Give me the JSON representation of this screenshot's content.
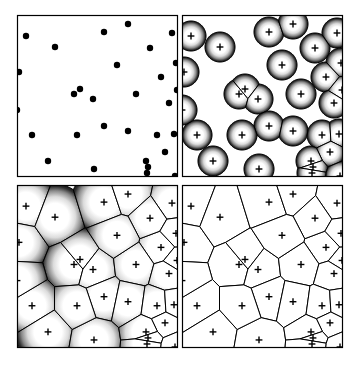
{
  "figure": {
    "type": "scientific-diagram",
    "background_color": "#ffffff",
    "line_color": "#000000",
    "seed_marker_color": "#000000",
    "grain_fill_light": "#ffffff",
    "grain_fill_dark": "#1a1a1a",
    "panel_count": 4,
    "panel_layout": "2x2",
    "panels": [
      {
        "id": "panel-a",
        "stage": "nucleation",
        "marker_style": "filled-dot",
        "frame": {
          "x": 17,
          "y": 15,
          "w": 161,
          "h": 162
        },
        "grain_radius": 0
      },
      {
        "id": "panel-b",
        "stage": "early-growth",
        "marker_style": "plus",
        "frame": {
          "x": 182,
          "y": 15,
          "w": 161,
          "h": 162
        },
        "grain_radius": 15
      },
      {
        "id": "panel-c",
        "stage": "impingement",
        "marker_style": "plus",
        "frame": {
          "x": 17,
          "y": 185,
          "w": 161,
          "h": 163
        },
        "grain_radius": 33
      },
      {
        "id": "panel-d",
        "stage": "full-tessellation",
        "marker_style": "plus",
        "frame": {
          "x": 182,
          "y": 185,
          "w": 161,
          "h": 163
        },
        "grain_radius": 200
      }
    ]
  },
  "chart_data": {
    "type": "scatter",
    "xlabel": "",
    "ylabel": "",
    "xlim": [
      0,
      161
    ],
    "ylim": [
      0,
      162
    ],
    "grid": false,
    "legend": "none",
    "seed_count": 30,
    "seeds": [
      {
        "id": 1,
        "x": 9,
        "y": 21
      },
      {
        "id": 2,
        "x": 2,
        "y": 57
      },
      {
        "id": 3,
        "x": 38,
        "y": 32
      },
      {
        "id": 4,
        "x": 87,
        "y": 17
      },
      {
        "id": 5,
        "x": 111,
        "y": 9
      },
      {
        "id": 6,
        "x": 155,
        "y": 18
      },
      {
        "id": 7,
        "x": 144,
        "y": 62
      },
      {
        "id": 8,
        "x": 160,
        "y": 75
      },
      {
        "id": 9,
        "x": 57,
        "y": 79
      },
      {
        "id": 10,
        "x": 63,
        "y": 74
      },
      {
        "id": 11,
        "x": 76,
        "y": 84
      },
      {
        "id": 12,
        "x": 119,
        "y": 79
      },
      {
        "id": 13,
        "x": 152,
        "y": 88
      },
      {
        "id": 14,
        "x": 87,
        "y": 111
      },
      {
        "id": 15,
        "x": 111,
        "y": 116
      },
      {
        "id": 16,
        "x": 15,
        "y": 120
      },
      {
        "id": 17,
        "x": 140,
        "y": 120
      },
      {
        "id": 18,
        "x": 157,
        "y": 119
      },
      {
        "id": 19,
        "x": 148,
        "y": 137
      },
      {
        "id": 20,
        "x": 31,
        "y": 146
      },
      {
        "id": 21,
        "x": 77,
        "y": 154
      },
      {
        "id": 22,
        "x": 129,
        "y": 146
      },
      {
        "id": 23,
        "x": 131,
        "y": 152
      },
      {
        "id": 24,
        "x": 130,
        "y": 158
      },
      {
        "id": 25,
        "x": 158,
        "y": 161
      },
      {
        "id": 26,
        "x": 133,
        "y": 33
      },
      {
        "id": 27,
        "x": 0,
        "y": 95
      },
      {
        "id": 28,
        "x": 159,
        "y": 48
      },
      {
        "id": 29,
        "x": 100,
        "y": 50
      },
      {
        "id": 30,
        "x": 60,
        "y": 120
      }
    ]
  }
}
